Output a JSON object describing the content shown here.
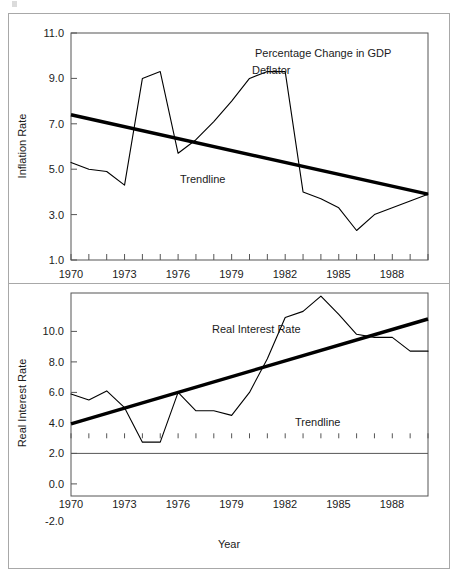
{
  "figure": {
    "panels": [
      {
        "id": "inflation",
        "chart_title": "Percentage Change in GDP",
        "chart_title_line2": "Deflator",
        "ylabel": "Inflation Rate",
        "series_annotation": "Trendline",
        "ytick_labels": [
          "11.0",
          "9.0",
          "7.0",
          "5.0",
          "3.0",
          "1.0"
        ],
        "xtick_labels": [
          "1970",
          "1973",
          "1976",
          "1979",
          "1982",
          "1985",
          "1988"
        ]
      },
      {
        "id": "real-interest",
        "ylabel": "Real Interest Rate",
        "series_annotation": "Real Interest Rate",
        "trend_annotation": "Trendline",
        "xlabel": "Year",
        "ytick_labels": [
          "10.0",
          "8.0",
          "6.0",
          "4.0",
          "2.0",
          "0.0",
          "-2.0"
        ],
        "xtick_labels": [
          "1970",
          "1973",
          "1976",
          "1979",
          "1982",
          "1985",
          "1988"
        ]
      }
    ]
  },
  "colors": {
    "line": "#000000",
    "trendline": "#000000",
    "axis": "#555555",
    "frame": "#a8a8a8",
    "text": "#1b1b1b",
    "background": "#ffffff"
  },
  "chart_data": [
    {
      "type": "line",
      "id": "inflation-panel",
      "title": "Percentage Change in GDP Deflator",
      "xlabel": "",
      "ylabel": "Inflation Rate",
      "xlim": [
        1970,
        1990
      ],
      "ylim": [
        1.0,
        11.0
      ],
      "yticks": [
        1.0,
        3.0,
        5.0,
        7.0,
        9.0,
        11.0
      ],
      "xticks": [
        1970,
        1973,
        1976,
        1979,
        1982,
        1985,
        1988
      ],
      "grid": false,
      "legend": "none",
      "annotations": [
        {
          "text": "Percentage Change in GDP Deflator",
          "x": 1982,
          "y": 10.4
        },
        {
          "text": "Trendline",
          "x": 1978.2,
          "y": 5.2
        }
      ],
      "x": [
        1970,
        1971,
        1972,
        1973,
        1974,
        1975,
        1976,
        1977,
        1978,
        1979,
        1980,
        1981,
        1982,
        1983,
        1984,
        1985,
        1986,
        1987,
        1988,
        1989,
        1990
      ],
      "series": [
        {
          "name": "Percentage Change in GDP Deflator",
          "values": [
            5.3,
            5.0,
            4.9,
            4.3,
            9.0,
            9.3,
            5.7,
            6.3,
            7.1,
            8.0,
            9.0,
            9.3,
            9.3,
            4.0,
            3.7,
            3.3,
            2.3,
            3.0,
            3.3,
            3.6,
            3.9
          ]
        },
        {
          "name": "Trendline",
          "kind": "linear-fit",
          "endpoints": [
            [
              1970,
              7.4
            ],
            [
              1990,
              3.9
            ]
          ],
          "values": [
            7.4,
            7.225,
            7.05,
            6.875,
            6.7,
            6.525,
            6.35,
            6.175,
            6.0,
            5.825,
            5.65,
            5.475,
            5.3,
            5.125,
            4.95,
            4.775,
            4.6,
            4.425,
            4.25,
            4.075,
            3.9
          ]
        }
      ]
    },
    {
      "type": "line",
      "id": "real-interest-panel",
      "title": "",
      "xlabel": "Year",
      "ylabel": "Real Interest Rate",
      "xlim": [
        1970,
        1990
      ],
      "ylim": [
        -2.0,
        11.5
      ],
      "yticks": [
        -2.0,
        0.0,
        2.0,
        4.0,
        6.0,
        8.0,
        10.0
      ],
      "xticks": [
        1970,
        1973,
        1976,
        1979,
        1982,
        1985,
        1988
      ],
      "grid": false,
      "legend": "none",
      "annotations": [
        {
          "text": "Real Interest Rate",
          "x": 1978.3,
          "y": 9.2
        },
        {
          "text": "Trendline",
          "x": 1983.6,
          "y": 4.1
        }
      ],
      "x": [
        1970,
        1971,
        1972,
        1973,
        1974,
        1975,
        1976,
        1977,
        1978,
        1979,
        1980,
        1981,
        1982,
        1983,
        1984,
        1985,
        1986,
        1987,
        1988,
        1989,
        1990
      ],
      "series": [
        {
          "name": "Real Interest Rate",
          "values": [
            4.9,
            4.5,
            5.1,
            4.0,
            1.75,
            1.75,
            5.0,
            3.8,
            3.8,
            3.5,
            5.0,
            7.2,
            9.9,
            10.3,
            11.3,
            10.1,
            8.8,
            8.6,
            8.6,
            7.7,
            7.7
          ]
        },
        {
          "name": "Trendline",
          "kind": "linear-fit",
          "endpoints": [
            [
              1970,
              2.95
            ],
            [
              1990,
              9.8
            ]
          ],
          "values": [
            2.95,
            3.2925,
            3.635,
            3.9775,
            4.32,
            4.6625,
            5.005,
            5.3475,
            5.69,
            6.0325,
            6.375,
            6.7175,
            7.06,
            7.4025,
            7.745,
            8.0875,
            8.43,
            8.7725,
            9.115,
            9.4575,
            9.8
          ]
        }
      ]
    }
  ]
}
